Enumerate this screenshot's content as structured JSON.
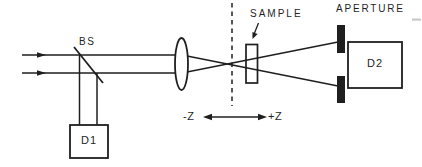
{
  "figure": {
    "labels": {
      "beam_splitter": "BS",
      "detector_1": "D1",
      "sample": "SAMPLE",
      "aperture": "APERTURE",
      "detector_2": "D2",
      "z_negative": "-Z",
      "z_positive": "+Z"
    },
    "colors": {
      "ink": "#1f1f1f",
      "background": "#ffffff",
      "scan_artifact": "#c9c9c9"
    },
    "elements": [
      "input-beams",
      "beam-splitter",
      "detector-d1",
      "lens",
      "focal-plane-dashed-line",
      "sample-cell",
      "sample-pointer-arrow",
      "aperture-bars",
      "detector-d2",
      "z-axis-double-arrow"
    ]
  }
}
